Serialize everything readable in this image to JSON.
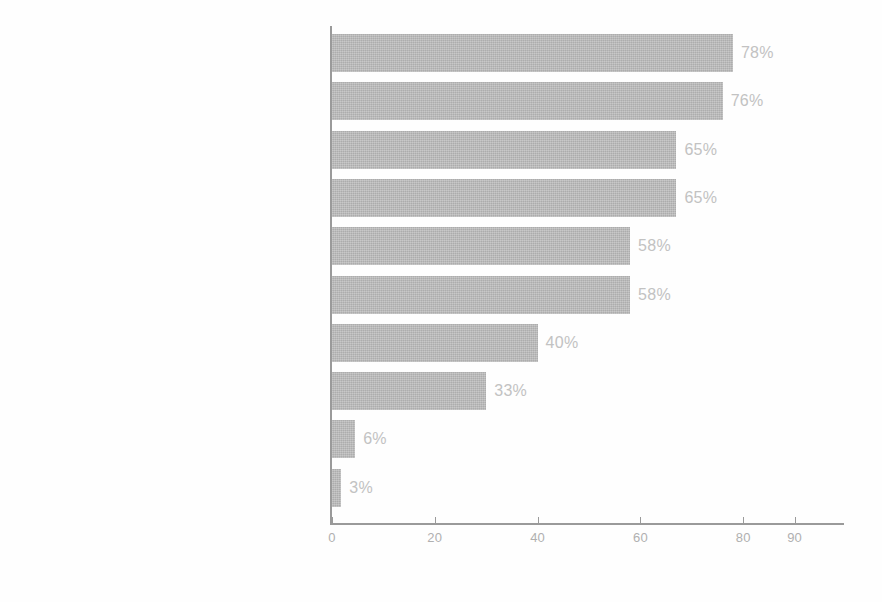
{
  "chart_data": {
    "type": "bar",
    "orientation": "horizontal",
    "title": "",
    "subtitle": "",
    "xlabel": "",
    "ylabel": "",
    "xlim": [
      0,
      90
    ],
    "grid": false,
    "legend": false,
    "legend_position": "none",
    "value_suffix": "%",
    "bar_color": "#b3b3b3",
    "label_color": "#7d7d7d",
    "value_label_color": "#c2c2c2",
    "axis_color": "#9a9a9a",
    "background_color": "#ffffff",
    "xticks": [
      0,
      20,
      40,
      60,
      80,
      90
    ],
    "xtick_labels": [
      "0",
      "20",
      "40",
      "60",
      "80",
      "90"
    ],
    "categories": [
      "Keyword Research",
      "Website Analytics",
      "Secondary Research (e.g., internet searches)",
      "Social Media Listening",
      "Primary Research (e.g., quantitative, qualitative)",
      "Sales Team Feedback",
      "Database Analysis",
      "Customer Conversations/Panels",
      "AI-powered Audience Analysis",
      "Other techniques"
    ],
    "values": [
      78,
      76,
      65,
      65,
      58,
      58,
      40,
      33,
      6,
      3
    ],
    "value_labels": [
      "78%",
      "76%",
      "65%",
      "65%",
      "58%",
      "58%",
      "40%",
      "33%",
      "6%",
      "3%"
    ],
    "bar_extents": [
      78,
      76,
      67,
      67,
      58,
      58,
      40,
      30,
      4.5,
      1.8
    ]
  }
}
